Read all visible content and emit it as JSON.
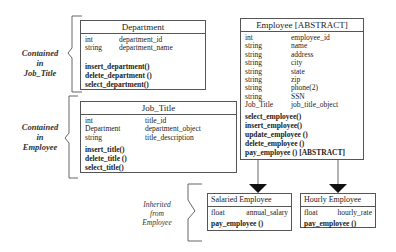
{
  "classes": {
    "department": {
      "title": "Department",
      "attributes": [
        {
          "type": "int",
          "name": "department_id"
        },
        {
          "type": "string",
          "name": "department_name"
        }
      ],
      "methods": [
        "insert_department()",
        "delete_department ()",
        "select_department()"
      ]
    },
    "job_title": {
      "title": "Job_Title",
      "attributes": [
        {
          "type": "int",
          "name": "title_id"
        },
        {
          "type": "Department",
          "name": "department_object"
        },
        {
          "type": "string",
          "name": "title_description"
        }
      ],
      "methods": [
        "insert_title()",
        "delete_title ()",
        "select_title()"
      ]
    },
    "employee": {
      "title": "Employee [ABSTRACT]",
      "attributes": [
        {
          "type": "int",
          "name": "employee_id"
        },
        {
          "type": "string",
          "name": "name"
        },
        {
          "type": "string",
          "name": "address"
        },
        {
          "type": "string",
          "name": "city"
        },
        {
          "type": "string",
          "name": "state"
        },
        {
          "type": "string",
          "name": "zip"
        },
        {
          "type": "string",
          "name": "phone(2)"
        },
        {
          "type": "string",
          "name": "SSN"
        },
        {
          "type": "Job_Title",
          "name": "job_title_object"
        }
      ],
      "methods": [
        "select_employee()",
        "insert_employee()",
        "update_employee ()",
        "delete_employee ()",
        "pay_employee () [ABSTRACT]"
      ]
    },
    "salaried_employee": {
      "title": "Salaried Employee",
      "attributes": [
        {
          "type": "float",
          "name": "annual_salary"
        }
      ],
      "methods": [
        "pay_employee ()"
      ]
    },
    "hourly_employee": {
      "title": "Hourly Employee",
      "attributes": [
        {
          "type": "float",
          "name": "hourly_rate"
        }
      ],
      "methods": [
        "pay_employee ()"
      ]
    }
  },
  "annotations": {
    "contained_in_job_title": [
      "Contained",
      "in",
      "Job_Title"
    ],
    "contained_in_employee": [
      "Contained",
      "in",
      "Employee"
    ],
    "inherited_from_employee": [
      "Inherited",
      "from",
      "Employee"
    ]
  }
}
